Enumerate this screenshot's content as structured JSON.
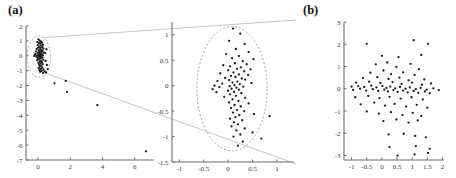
{
  "figure": {
    "panels": [
      {
        "id": "panel-a",
        "label": "(a)"
      },
      {
        "id": "panel-b",
        "label": "(b)"
      }
    ]
  },
  "chart_data": [
    {
      "type": "scatter",
      "id": "overview",
      "panel": "(a)",
      "title": "",
      "xlabel": "",
      "ylabel": "",
      "xlim": [
        -0.75,
        7.2
      ],
      "ylim": [
        -7,
        2
      ],
      "xticks": [
        0,
        2,
        4,
        6
      ],
      "yticks": [
        2,
        1,
        0,
        -1,
        -2,
        -3,
        -4,
        -5,
        -6,
        -7
      ],
      "xticklabels": [
        "0",
        "2",
        "4",
        "6"
      ],
      "yticklabels": [
        "2",
        "1",
        "0",
        "-1",
        "-2",
        "-3",
        "-4",
        "-5",
        "-6",
        "-7"
      ],
      "grid": false,
      "legend": null,
      "annotations": [
        {
          "kind": "dashed-circle",
          "cx": 0.05,
          "cy": -0.05,
          "rx": 0.72,
          "ry": 1.38
        },
        {
          "kind": "leader-line",
          "comment": "top connector to magnified panel"
        },
        {
          "kind": "leader-line",
          "comment": "bottom connector to magnified panel"
        }
      ],
      "points": [
        [
          0.02,
          1.1
        ],
        [
          0.1,
          1.02
        ],
        [
          0.17,
          0.96
        ],
        [
          -0.05,
          0.92
        ],
        [
          0.24,
          0.88
        ],
        [
          0.06,
          0.85
        ],
        [
          0.13,
          0.8
        ],
        [
          0.3,
          0.74
        ],
        [
          -0.02,
          0.72
        ],
        [
          0.2,
          0.68
        ],
        [
          0.08,
          0.62
        ],
        [
          0.26,
          0.58
        ],
        [
          0.01,
          0.55
        ],
        [
          0.15,
          0.52
        ],
        [
          0.33,
          0.48
        ],
        [
          -0.08,
          0.46
        ],
        [
          0.11,
          0.42
        ],
        [
          0.22,
          0.38
        ],
        [
          0.04,
          0.35
        ],
        [
          0.28,
          0.32
        ],
        [
          -0.12,
          0.3
        ],
        [
          0.17,
          0.27
        ],
        [
          0.07,
          0.24
        ],
        [
          0.35,
          0.21
        ],
        [
          0.0,
          0.19
        ],
        [
          0.19,
          0.16
        ],
        [
          -0.16,
          0.14
        ],
        [
          0.12,
          0.12
        ],
        [
          0.25,
          0.1
        ],
        [
          0.03,
          0.08
        ],
        [
          -0.2,
          0.06
        ],
        [
          0.09,
          0.05
        ],
        [
          0.3,
          0.03
        ],
        [
          -0.06,
          0.02
        ],
        [
          0.15,
          0.0
        ],
        [
          -0.24,
          -0.01
        ],
        [
          0.05,
          -0.03
        ],
        [
          0.21,
          -0.05
        ],
        [
          -0.1,
          -0.07
        ],
        [
          0.12,
          -0.09
        ],
        [
          0.27,
          -0.12
        ],
        [
          -0.02,
          -0.15
        ],
        [
          0.16,
          -0.18
        ],
        [
          0.06,
          -0.22
        ],
        [
          0.32,
          -0.26
        ],
        [
          -0.05,
          -0.3
        ],
        [
          0.19,
          -0.34
        ],
        [
          0.1,
          -0.38
        ],
        [
          0.24,
          -0.43
        ],
        [
          0.02,
          -0.47
        ],
        [
          0.14,
          -0.52
        ],
        [
          0.29,
          -0.56
        ],
        [
          0.07,
          -0.61
        ],
        [
          0.2,
          -0.66
        ],
        [
          0.11,
          -0.72
        ],
        [
          0.26,
          -0.78
        ],
        [
          0.04,
          -0.83
        ],
        [
          0.17,
          -0.88
        ],
        [
          0.34,
          -0.92
        ],
        [
          0.09,
          -0.97
        ],
        [
          0.22,
          -1.02
        ],
        [
          0.41,
          -1.05
        ],
        [
          0.13,
          -1.08
        ],
        [
          0.5,
          -1.12
        ],
        [
          0.31,
          -1.15
        ],
        [
          0.6,
          -0.9
        ],
        [
          0.55,
          -0.62
        ],
        [
          0.47,
          -0.35
        ],
        [
          0.44,
          0.18
        ],
        [
          0.52,
          0.44
        ],
        [
          1.02,
          -1.85
        ],
        [
          1.72,
          -1.68
        ],
        [
          1.8,
          -2.42
        ],
        [
          3.68,
          -3.32
        ],
        [
          6.7,
          -6.42
        ]
      ]
    },
    {
      "type": "scatter",
      "id": "magnified",
      "panel": "(a)",
      "title": "",
      "xlabel": "",
      "ylabel": "",
      "xlim": [
        -1.15,
        1.35
      ],
      "ylim": [
        -1.5,
        1.25
      ],
      "xticks": [
        -1,
        -0.5,
        0,
        0.5,
        1
      ],
      "yticks": [
        1,
        0.5,
        0,
        -0.5,
        -1,
        -1.5
      ],
      "xticklabels": [
        "-1",
        "-0.5",
        "0",
        "0.5",
        "1"
      ],
      "yticklabels": [
        "1",
        "0.5",
        "0",
        "-0.5",
        "-1",
        "-1.5"
      ],
      "grid": false,
      "legend": null,
      "annotations": [
        {
          "kind": "dashed-circle",
          "cx": 0.08,
          "cy": -0.06,
          "rx": 0.72,
          "ry": 1.22
        }
      ],
      "points": [
        [
          0.1,
          1.12
        ],
        [
          0.25,
          1.02
        ],
        [
          0.02,
          0.88
        ],
        [
          0.34,
          0.82
        ],
        [
          0.16,
          0.72
        ],
        [
          0.42,
          0.66
        ],
        [
          -0.04,
          0.62
        ],
        [
          0.22,
          0.58
        ],
        [
          0.08,
          0.54
        ],
        [
          0.52,
          0.52
        ],
        [
          0.3,
          0.48
        ],
        [
          0.14,
          0.44
        ],
        [
          0.38,
          0.42
        ],
        [
          -0.1,
          0.4
        ],
        [
          0.04,
          0.38
        ],
        [
          0.26,
          0.36
        ],
        [
          0.18,
          0.33
        ],
        [
          0.46,
          0.32
        ],
        [
          0.0,
          0.3
        ],
        [
          0.33,
          0.28
        ],
        [
          0.11,
          0.26
        ],
        [
          -0.16,
          0.24
        ],
        [
          0.22,
          0.22
        ],
        [
          0.41,
          0.21
        ],
        [
          0.06,
          0.19
        ],
        [
          0.15,
          0.17
        ],
        [
          -0.06,
          0.15
        ],
        [
          0.28,
          0.14
        ],
        [
          0.35,
          0.12
        ],
        [
          0.02,
          0.11
        ],
        [
          -0.22,
          0.09
        ],
        [
          0.19,
          0.08
        ],
        [
          0.09,
          0.06
        ],
        [
          0.48,
          0.05
        ],
        [
          -0.12,
          0.04
        ],
        [
          0.24,
          0.03
        ],
        [
          0.13,
          0.01
        ],
        [
          -0.28,
          0.0
        ],
        [
          0.03,
          -0.01
        ],
        [
          0.31,
          -0.02
        ],
        [
          -0.18,
          -0.03
        ],
        [
          0.17,
          -0.04
        ],
        [
          0.07,
          -0.06
        ],
        [
          -0.32,
          -0.07
        ],
        [
          0.22,
          -0.08
        ],
        [
          0.0,
          -0.1
        ],
        [
          0.12,
          -0.12
        ],
        [
          -0.24,
          -0.13
        ],
        [
          0.27,
          -0.15
        ],
        [
          0.04,
          -0.17
        ],
        [
          0.16,
          -0.2
        ],
        [
          -0.08,
          -0.22
        ],
        [
          0.35,
          -0.24
        ],
        [
          0.09,
          -0.27
        ],
        [
          0.21,
          -0.3
        ],
        [
          0.02,
          -0.33
        ],
        [
          0.42,
          -0.35
        ],
        [
          0.13,
          -0.38
        ],
        [
          0.26,
          -0.41
        ],
        [
          0.06,
          -0.44
        ],
        [
          0.18,
          -0.48
        ],
        [
          0.33,
          -0.5
        ],
        [
          0.1,
          -0.53
        ],
        [
          0.53,
          -0.56
        ],
        [
          0.23,
          -0.58
        ],
        [
          0.15,
          -0.62
        ],
        [
          0.04,
          -0.65
        ],
        [
          0.29,
          -0.68
        ],
        [
          0.85,
          -0.6
        ],
        [
          0.12,
          -0.72
        ],
        [
          0.2,
          -0.76
        ],
        [
          0.07,
          -0.8
        ],
        [
          0.34,
          -0.84
        ],
        [
          0.17,
          -0.88
        ],
        [
          0.5,
          -0.92
        ],
        [
          0.25,
          -0.96
        ],
        [
          0.11,
          -1.0
        ],
        [
          0.68,
          -1.04
        ],
        [
          0.3,
          -1.1
        ],
        [
          0.2,
          -1.18
        ]
      ]
    },
    {
      "type": "scatter",
      "id": "panel-b-scatter",
      "panel": "(b)",
      "title": "",
      "xlabel": "",
      "ylabel": "",
      "xlim": [
        -1.25,
        2.05
      ],
      "ylim": [
        -3.2,
        3.0
      ],
      "xticks": [
        -1,
        -0.5,
        0,
        0.5,
        1,
        1.5,
        2
      ],
      "yticks": [
        3,
        2,
        1,
        0,
        -1,
        -2,
        -3
      ],
      "xticklabels": [
        "-1",
        "-0.5",
        "0",
        "0.5",
        "1",
        "1.5",
        "2"
      ],
      "yticklabels": [
        "3",
        "2",
        "1",
        "0",
        "-1",
        "-2",
        "-3"
      ],
      "grid": false,
      "legend": null,
      "annotations": [],
      "points": [
        [
          -0.5,
          2.02
        ],
        [
          1.05,
          2.18
        ],
        [
          1.52,
          2.02
        ],
        [
          0.0,
          1.48
        ],
        [
          0.55,
          1.42
        ],
        [
          1.3,
          1.52
        ],
        [
          -0.2,
          1.1
        ],
        [
          0.18,
          1.18
        ],
        [
          0.48,
          0.98
        ],
        [
          0.95,
          1.12
        ],
        [
          1.22,
          0.88
        ],
        [
          -0.38,
          0.72
        ],
        [
          0.05,
          0.82
        ],
        [
          0.3,
          0.66
        ],
        [
          0.7,
          0.74
        ],
        [
          1.08,
          0.62
        ],
        [
          -0.62,
          0.48
        ],
        [
          -0.15,
          0.52
        ],
        [
          0.22,
          0.44
        ],
        [
          0.58,
          0.5
        ],
        [
          0.88,
          0.38
        ],
        [
          1.4,
          0.42
        ],
        [
          -0.85,
          0.28
        ],
        [
          -0.42,
          0.32
        ],
        [
          -0.05,
          0.26
        ],
        [
          0.35,
          0.3
        ],
        [
          0.65,
          0.22
        ],
        [
          1.0,
          0.28
        ],
        [
          1.32,
          0.18
        ],
        [
          1.62,
          0.24
        ],
        [
          -1.0,
          0.1
        ],
        [
          -0.78,
          0.12
        ],
        [
          -0.58,
          0.08
        ],
        [
          -0.35,
          0.14
        ],
        [
          -0.18,
          0.06
        ],
        [
          0.02,
          0.12
        ],
        [
          0.15,
          0.04
        ],
        [
          0.28,
          0.1
        ],
        [
          0.44,
          0.02
        ],
        [
          0.6,
          0.08
        ],
        [
          0.78,
          0.0
        ],
        [
          0.92,
          0.06
        ],
        [
          1.12,
          -0.02
        ],
        [
          1.28,
          0.04
        ],
        [
          1.48,
          -0.04
        ],
        [
          1.7,
          0.02
        ],
        [
          1.88,
          -0.06
        ],
        [
          -0.95,
          -0.05
        ],
        [
          -0.72,
          0.0
        ],
        [
          -0.52,
          -0.08
        ],
        [
          -0.3,
          -0.02
        ],
        [
          -0.12,
          -0.1
        ],
        [
          0.08,
          -0.04
        ],
        [
          0.2,
          -0.12
        ],
        [
          0.38,
          -0.06
        ],
        [
          0.52,
          -0.14
        ],
        [
          0.7,
          -0.08
        ],
        [
          0.85,
          -0.16
        ],
        [
          1.05,
          -0.1
        ],
        [
          1.2,
          -0.18
        ],
        [
          1.42,
          -0.12
        ],
        [
          1.58,
          -0.2
        ],
        [
          -0.88,
          -0.38
        ],
        [
          -0.45,
          -0.32
        ],
        [
          -0.08,
          -0.42
        ],
        [
          0.25,
          -0.36
        ],
        [
          0.62,
          -0.44
        ],
        [
          0.98,
          -0.38
        ],
        [
          1.35,
          -0.48
        ],
        [
          -0.7,
          -0.7
        ],
        [
          -0.25,
          -0.62
        ],
        [
          0.1,
          -0.76
        ],
        [
          0.42,
          -0.68
        ],
        [
          0.8,
          -0.8
        ],
        [
          1.15,
          -0.72
        ],
        [
          1.5,
          -0.85
        ],
        [
          -0.5,
          -1.02
        ],
        [
          -0.1,
          -1.12
        ],
        [
          0.3,
          -1.05
        ],
        [
          0.68,
          -1.18
        ],
        [
          1.02,
          -1.08
        ],
        [
          1.3,
          -1.22
        ],
        [
          0.05,
          -1.45
        ],
        [
          0.48,
          -1.38
        ],
        [
          0.88,
          -1.52
        ],
        [
          1.18,
          -1.42
        ],
        [
          0.22,
          -2.05
        ],
        [
          0.72,
          -2.02
        ],
        [
          1.1,
          -2.12
        ],
        [
          1.45,
          -2.18
        ],
        [
          0.25,
          -2.62
        ],
        [
          1.12,
          -2.58
        ],
        [
          1.58,
          -2.7
        ],
        [
          0.52,
          -3.0
        ],
        [
          1.08,
          -2.95
        ],
        [
          1.52,
          -2.88
        ]
      ]
    }
  ]
}
